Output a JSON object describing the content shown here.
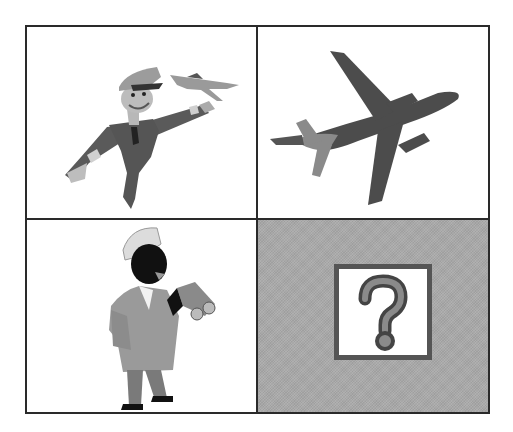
{
  "puzzle": {
    "type": "2x2 picture analogy grid",
    "cells": [
      {
        "position": "top-left",
        "content": "pilot holding toy airplane",
        "icon": "pilot-icon"
      },
      {
        "position": "top-right",
        "content": "airplane in flight",
        "icon": "airplane-icon"
      },
      {
        "position": "bottom-left",
        "content": "ship captain with binoculars",
        "icon": "captain-icon"
      },
      {
        "position": "bottom-right",
        "content": "unknown answer",
        "icon": "question-mark-icon",
        "symbol": "?"
      }
    ],
    "colors": {
      "border": "#2a2a2a",
      "answer_cell_bg": "#a9a9a9",
      "figure_dark": "#4a4a4a",
      "figure_mid": "#8a8a8a",
      "figure_light": "#c4c4c4"
    }
  }
}
